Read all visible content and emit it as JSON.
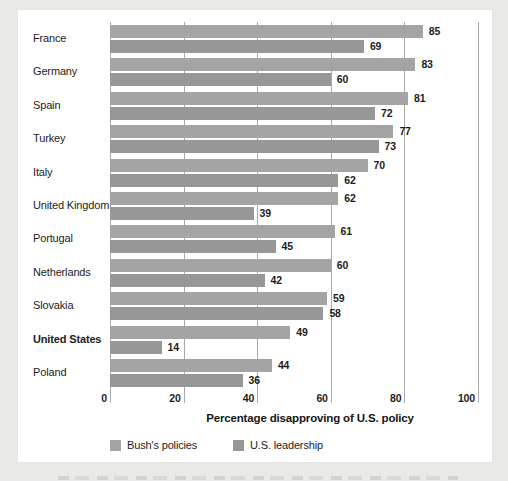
{
  "chart_data": {
    "type": "bar",
    "orientation": "horizontal",
    "title": "",
    "xlabel": "Percentage disapproving of U.S. policy",
    "ylabel": "",
    "xlim": [
      0,
      100
    ],
    "xticks": [
      0,
      20,
      40,
      60,
      80,
      100
    ],
    "grid": true,
    "value_labels": true,
    "legend_position": "bottom",
    "bold_category": "United States",
    "categories": [
      "France",
      "Germany",
      "Spain",
      "Turkey",
      "Italy",
      "United Kingdom",
      "Portugal",
      "Netherlands",
      "Slovakia",
      "United States",
      "Poland"
    ],
    "series": [
      {
        "name": "Bush's policies",
        "color": "#a4a4a4",
        "values": [
          85,
          83,
          81,
          77,
          70,
          62,
          61,
          60,
          59,
          49,
          44
        ]
      },
      {
        "name": "U.S. leadership",
        "color": "#979797",
        "values": [
          69,
          60,
          72,
          73,
          62,
          39,
          45,
          42,
          58,
          14,
          36
        ]
      }
    ]
  },
  "colors": {
    "page_background": "#e9eae5",
    "panel_background": "#ffffff",
    "gridline": "#a9a9a9",
    "text": "#1c1c1c"
  }
}
